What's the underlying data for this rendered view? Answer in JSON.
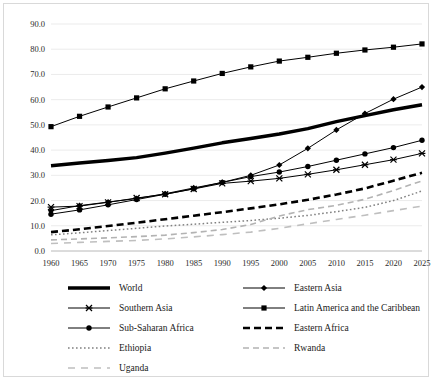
{
  "chart_data": {
    "type": "line",
    "title": "",
    "xlabel": "",
    "ylabel": "",
    "x": [
      1960,
      1965,
      1970,
      1975,
      1980,
      1985,
      1990,
      1995,
      2000,
      2005,
      2010,
      2015,
      2020,
      2025
    ],
    "xlim": [
      1960,
      2025
    ],
    "ylim": [
      0,
      90
    ],
    "yticks": [
      "0.0",
      "10.0",
      "20.0",
      "30.0",
      "40.0",
      "50.0",
      "60.0",
      "70.0",
      "80.0",
      "90.0"
    ],
    "xticks": [
      "1960",
      "1965",
      "1970",
      "1975",
      "1980",
      "1985",
      "1990",
      "1995",
      "2000",
      "2005",
      "2010",
      "2015",
      "2020",
      "2025"
    ],
    "grid": "horizontal",
    "legend_position": "bottom",
    "legend_columns": 2,
    "series": [
      {
        "name": "World",
        "style": "solid-thick",
        "marker": "none",
        "color": "#000000",
        "values": [
          33.8,
          34.9,
          35.9,
          37.0,
          38.8,
          40.8,
          42.9,
          44.6,
          46.4,
          48.5,
          51.3,
          53.7,
          56.0,
          58.0
        ]
      },
      {
        "name": "Eastern Asia",
        "style": "solid-thin",
        "marker": "diamond",
        "color": "#000000",
        "values": [
          16.0,
          18.0,
          19.4,
          20.8,
          22.7,
          25.0,
          27.2,
          30.0,
          34.1,
          40.7,
          48.0,
          54.5,
          60.2,
          65.0
        ]
      },
      {
        "name": "Southern Asia",
        "style": "solid-thin",
        "marker": "cross",
        "color": "#000000",
        "values": [
          17.4,
          17.8,
          19.3,
          21.0,
          22.5,
          24.6,
          26.8,
          27.7,
          28.8,
          30.4,
          32.2,
          34.2,
          36.2,
          38.7
        ]
      },
      {
        "name": "Latin America and the Caribbean",
        "style": "solid-thin",
        "marker": "square",
        "color": "#000000",
        "values": [
          49.3,
          53.4,
          57.1,
          60.7,
          64.3,
          67.4,
          70.4,
          73.0,
          75.3,
          76.8,
          78.4,
          79.7,
          80.8,
          82.1
        ]
      },
      {
        "name": "Sub-Saharan Africa",
        "style": "solid-thin",
        "marker": "circle",
        "color": "#000000",
        "values": [
          14.6,
          16.3,
          18.3,
          20.4,
          22.5,
          24.7,
          27.2,
          29.5,
          31.3,
          33.5,
          36.0,
          38.5,
          41.0,
          43.9
        ]
      },
      {
        "name": "Eastern Africa",
        "style": "dashed-bold",
        "marker": "none",
        "color": "#000000",
        "values": [
          7.5,
          8.6,
          9.9,
          11.2,
          12.6,
          14.0,
          15.4,
          16.9,
          18.5,
          20.3,
          22.4,
          24.8,
          27.9,
          31.0
        ]
      },
      {
        "name": "Ethiopia",
        "style": "dotted",
        "marker": "none",
        "color": "#808080",
        "values": [
          6.4,
          7.2,
          8.1,
          9.0,
          9.9,
          10.6,
          11.4,
          12.1,
          13.0,
          14.1,
          15.6,
          17.3,
          20.0,
          23.8
        ]
      },
      {
        "name": "Rwanda",
        "style": "dashed-light",
        "marker": "none",
        "color": "#b3b3b3",
        "values": [
          4.4,
          4.8,
          5.2,
          5.7,
          6.3,
          7.3,
          8.5,
          10.5,
          13.9,
          16.4,
          18.1,
          20.5,
          24.0,
          27.8
        ]
      },
      {
        "name": "Uganda",
        "style": "dashed-light2",
        "marker": "none",
        "color": "#bfbfbf",
        "values": [
          3.0,
          3.4,
          3.8,
          4.2,
          4.8,
          5.6,
          6.5,
          7.5,
          9.0,
          10.8,
          12.5,
          14.2,
          16.0,
          17.8
        ]
      }
    ]
  },
  "legend": {
    "entries": [
      {
        "label": "World",
        "key": "World"
      },
      {
        "label": "Eastern Asia",
        "key": "Eastern Asia"
      },
      {
        "label": "Southern Asia",
        "key": "Southern Asia"
      },
      {
        "label": "Latin America and the Caribbean",
        "key": "Latin America and the Caribbean"
      },
      {
        "label": "Sub-Saharan Africa",
        "key": "Sub-Saharan Africa"
      },
      {
        "label": "Eastern Africa",
        "key": "Eastern Africa"
      },
      {
        "label": "Ethiopia",
        "key": "Ethiopia"
      },
      {
        "label": "Rwanda",
        "key": "Rwanda"
      },
      {
        "label": "Uganda",
        "key": "Uganda"
      }
    ]
  }
}
